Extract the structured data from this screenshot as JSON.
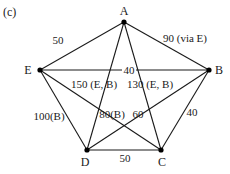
{
  "figure": {
    "panel_label": "(c)"
  },
  "nodes": [
    {
      "id": "A",
      "label": "A",
      "x": 124,
      "y": 22,
      "lx": 124,
      "ly": 15
    },
    {
      "id": "B",
      "label": "B",
      "x": 209,
      "y": 70,
      "lx": 219,
      "ly": 74
    },
    {
      "id": "C",
      "label": "C",
      "x": 161,
      "y": 150,
      "lx": 162,
      "ly": 166
    },
    {
      "id": "D",
      "label": "D",
      "x": 87,
      "y": 150,
      "lx": 85,
      "ly": 166
    },
    {
      "id": "E",
      "label": "E",
      "x": 40,
      "y": 70,
      "lx": 28,
      "ly": 74
    }
  ],
  "edges": [
    {
      "from": "A",
      "to": "E",
      "label": "50",
      "lx": 58,
      "ly": 44
    },
    {
      "from": "A",
      "to": "B",
      "label": "90 (via E)",
      "lx": 185,
      "ly": 42
    },
    {
      "from": "E",
      "to": "B",
      "label": "40",
      "lx": 129,
      "ly": 74
    },
    {
      "from": "A",
      "to": "D",
      "label": "150 (E, B)",
      "lx": 94,
      "ly": 88
    },
    {
      "from": "A",
      "to": "C",
      "label": "130 (E, B)",
      "lx": 150,
      "ly": 88
    },
    {
      "from": "E",
      "to": "D",
      "label": "100(B)",
      "lx": 49,
      "ly": 120
    },
    {
      "from": "E",
      "to": "C",
      "label": "80(B)",
      "lx": 112,
      "ly": 118
    },
    {
      "from": "B",
      "to": "D",
      "label": "60",
      "lx": 138,
      "ly": 118
    },
    {
      "from": "B",
      "to": "C",
      "label": "40",
      "lx": 192,
      "ly": 116
    },
    {
      "from": "D",
      "to": "C",
      "label": "50",
      "lx": 125,
      "ly": 162
    }
  ]
}
